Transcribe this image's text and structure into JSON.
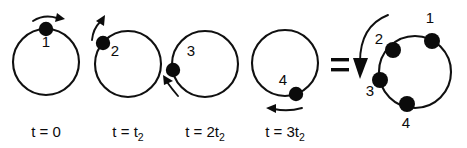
{
  "figure": {
    "equals_sign": "=",
    "colors": {
      "ink": "#0b0b0b",
      "stroke": "#101010",
      "background": "#ffffff"
    },
    "frames": [
      {
        "name": "frame-1",
        "time_label": "t = 0",
        "time_prefix": "t = ",
        "time_coefficient": "0",
        "time_subscript": "",
        "dot_label": "1",
        "dot_angle_deg": 90,
        "arrow_direction": "clockwise-right",
        "circle": {
          "cx": 46,
          "cy": 62,
          "r": 33
        },
        "dot": {
          "cx": 46,
          "cy": 29,
          "r": 7.2
        },
        "label_pos": {
          "x": 46,
          "y": 47
        }
      },
      {
        "name": "frame-2",
        "time_label": "t = t2",
        "time_prefix": "t = ",
        "time_coefficient": "t",
        "time_subscript": "2",
        "dot_label": "2",
        "dot_angle_deg": 140,
        "arrow_direction": "up-right",
        "circle": {
          "cx": 128,
          "cy": 64,
          "r": 33
        },
        "dot": {
          "cx": 103,
          "cy": 43,
          "r": 7.2
        },
        "label_pos": {
          "x": 117,
          "y": 54
        }
      },
      {
        "name": "frame-3",
        "time_label": "t = 2t2",
        "time_prefix": "t = ",
        "time_coefficient": "2t",
        "time_subscript": "2",
        "dot_label": "3",
        "dot_angle_deg": 188,
        "arrow_direction": "up-left",
        "circle": {
          "cx": 205,
          "cy": 64,
          "r": 33
        },
        "dot": {
          "cx": 173,
          "cy": 70,
          "r": 7.2
        },
        "label_pos": {
          "x": 191,
          "y": 54
        }
      },
      {
        "name": "frame-4",
        "time_label": "t = 3t2",
        "time_prefix": "t = ",
        "time_coefficient": "3t",
        "time_subscript": "2",
        "dot_label": "4",
        "dot_angle_deg": 290,
        "arrow_direction": "left",
        "circle": {
          "cx": 285,
          "cy": 63,
          "r": 33
        },
        "dot": {
          "cx": 296,
          "cy": 94,
          "r": 7.2
        },
        "label_pos": {
          "x": 283,
          "y": 83
        }
      }
    ],
    "summary": {
      "name": "combined-orbit",
      "circle": {
        "cx": 415,
        "cy": 72,
        "r": 36
      },
      "big_arrow_label": "time-progression-arrow",
      "dots": [
        {
          "label": "1",
          "angle_deg": 62,
          "cx": 432,
          "cy": 41,
          "r": 8.0,
          "label_x": 428,
          "label_y": 22
        },
        {
          "label": "2",
          "angle_deg": 128,
          "cx": 393,
          "cy": 50,
          "r": 8.0,
          "label_x": 377,
          "label_y": 45
        },
        {
          "label": "3",
          "angle_deg": 192,
          "cx": 380,
          "cy": 80,
          "r": 8.0,
          "label_x": 368,
          "label_y": 95
        },
        {
          "label": "4",
          "angle_deg": 254,
          "cx": 407,
          "cy": 104,
          "r": 8.0,
          "label_x": 404,
          "label_y": 128
        }
      ]
    }
  }
}
